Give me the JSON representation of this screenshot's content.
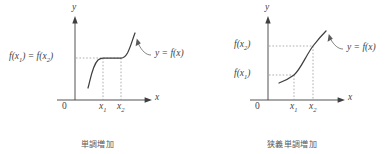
{
  "figure": {
    "kind": "math-diagram-pair",
    "ink_color": "#3f3f3f",
    "guide_color": "#8d8d8d",
    "background": "#ffffff"
  },
  "panels": [
    {
      "id": "monotone-increasing",
      "caption": "単調増加",
      "axis": {
        "y_label": "y",
        "x_label": "x",
        "origin_label": "0"
      },
      "y_value_labels": [
        {
          "text_html": "f(x<sub>1</sub>) = f(x<sub>2</sub>)",
          "text": "f(x1) = f(x2)"
        }
      ],
      "x_tick_labels": [
        {
          "text_html": "x<sub>1</sub>",
          "text": "x1"
        },
        {
          "text_html": "x<sub>2</sub>",
          "text": "x2"
        }
      ],
      "curve_annotation": {
        "text_html": "y = f(x)",
        "text": "y = f(x)"
      }
    },
    {
      "id": "strictly-monotone-increasing",
      "caption": "狭義単調増加",
      "axis": {
        "y_label": "y",
        "x_label": "x",
        "origin_label": "0"
      },
      "y_value_labels": [
        {
          "text_html": "f(x<sub>2</sub>)",
          "text": "f(x2)"
        },
        {
          "text_html": "f(x<sub>1</sub>)",
          "text": "f(x1)"
        }
      ],
      "x_tick_labels": [
        {
          "text_html": "x<sub>1</sub>",
          "text": "x1"
        },
        {
          "text_html": "x<sub>2</sub>",
          "text": "x2"
        }
      ],
      "curve_annotation": {
        "text_html": "y = f(x)",
        "text": "y = f(x)"
      }
    }
  ]
}
